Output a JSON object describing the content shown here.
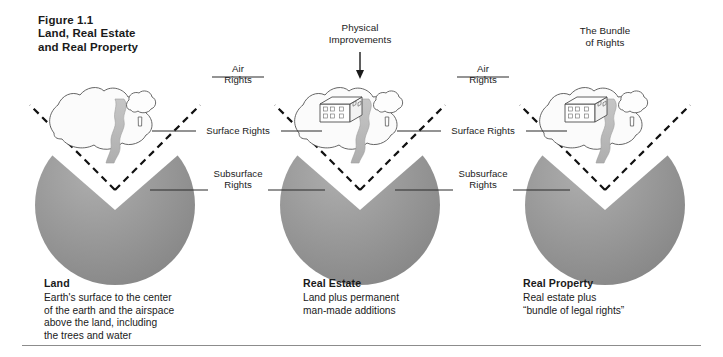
{
  "figure": {
    "number": "Figure 1.1",
    "title": "Figure 1.1\nLand, Real Estate\nand Real Property"
  },
  "colors": {
    "earth_gray": "#979797",
    "earth_gray_light": "#b2b2b2",
    "earth_gray_dark": "#7e7e7e",
    "water_gray": "#b9b9b9",
    "outline": "#3a3a3a",
    "dashed": "#1a1a1a",
    "rule": "#8c8c8c",
    "text": "#1a1a1a",
    "parcel_fill": "#fbfbfb"
  },
  "panels": [
    {
      "id": "land",
      "center_x": 115,
      "caption_title": "Land",
      "caption_body": "Earth's surface to the center\nof the earth and the airspace\nabove the land, including\nthe trees and water",
      "has_building": false,
      "has_tree": true,
      "has_water": true
    },
    {
      "id": "real-estate",
      "center_x": 360,
      "caption_title": "Real Estate",
      "caption_body": "Land plus permanent\nman-made additions",
      "has_building": true,
      "has_tree": true,
      "has_water": true
    },
    {
      "id": "real-property",
      "center_x": 605,
      "caption_title": "Real Property",
      "caption_body": "Real estate plus\n“bundle of legal rights”",
      "has_building": true,
      "has_tree": true,
      "has_water": true
    }
  ],
  "annotations": {
    "physical_improvements": "Physical\nImprovements",
    "bundle_of_rights": "The Bundle\nof Rights",
    "air_rights": "Air\nRights",
    "surface_rights": "Surface Rights",
    "subsurface_rights": "Subsurface\nRights"
  },
  "label_groups": [
    {
      "id": "gap-1",
      "center_x": 238,
      "air": "Air\nRights",
      "surface": "Surface Rights",
      "subsurface": "Subsurface\nRights"
    },
    {
      "id": "gap-2",
      "center_x": 483,
      "air": "Air\nRights",
      "surface": "Surface Rights",
      "subsurface": "Subsurface\nRights"
    }
  ]
}
